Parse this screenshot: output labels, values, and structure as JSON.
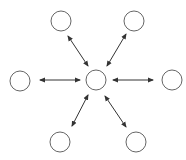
{
  "diagram": {
    "type": "star-network",
    "stroke_color": "#666666",
    "arrow_color": "#333333",
    "background": "#ffffff",
    "center_node": {
      "id": "center",
      "cx": 96,
      "cy": 80,
      "r": 10
    },
    "outer_nodes": [
      {
        "id": "top-left",
        "cx": 61,
        "cy": 21,
        "r": 10
      },
      {
        "id": "top-right",
        "cx": 134,
        "cy": 21,
        "r": 10
      },
      {
        "id": "left",
        "cx": 20,
        "cy": 81,
        "r": 10
      },
      {
        "id": "right",
        "cx": 172,
        "cy": 80,
        "r": 10
      },
      {
        "id": "bottom-left",
        "cx": 60,
        "cy": 142,
        "r": 10
      },
      {
        "id": "bottom-right",
        "cx": 136,
        "cy": 142,
        "r": 10
      }
    ],
    "edges": [
      {
        "from": "top-left",
        "to": "center",
        "x1": 68,
        "y1": 36,
        "x2": 88,
        "y2": 66,
        "bidirectional": true
      },
      {
        "from": "top-right",
        "to": "center",
        "x1": 126,
        "y1": 34,
        "x2": 107,
        "y2": 66,
        "bidirectional": true
      },
      {
        "from": "left",
        "to": "center",
        "x1": 40,
        "y1": 80,
        "x2": 80,
        "y2": 80,
        "bidirectional": true
      },
      {
        "from": "right",
        "to": "center",
        "x1": 153,
        "y1": 80,
        "x2": 113,
        "y2": 80,
        "bidirectional": true
      },
      {
        "from": "bottom-left",
        "to": "center",
        "x1": 72,
        "y1": 126,
        "x2": 88,
        "y2": 95,
        "bidirectional": true
      },
      {
        "from": "bottom-right",
        "to": "center",
        "x1": 126,
        "y1": 127,
        "x2": 105,
        "y2": 96,
        "bidirectional": true
      }
    ]
  }
}
